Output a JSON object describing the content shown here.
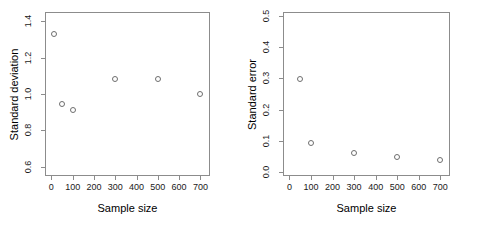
{
  "figure": {
    "panel_count": 2,
    "background": "#ffffff",
    "point_color": "#6e6e6e",
    "axis_color": "#8c8c8c"
  },
  "chart_data": [
    {
      "type": "scatter",
      "title": "",
      "xlabel": "Sample size",
      "ylabel": "Standard deviation",
      "x": [
        10,
        50,
        100,
        300,
        500,
        700
      ],
      "values": [
        1.33,
        0.945,
        0.91,
        1.08,
        1.08,
        1.0
      ],
      "xlim": [
        -30,
        745
      ],
      "ylim": [
        0.55,
        1.45
      ],
      "xticks": [
        0,
        100,
        200,
        300,
        400,
        500,
        600,
        700
      ],
      "xticklabels": [
        "0",
        "100",
        "200",
        "300",
        "400",
        "500",
        "600",
        "700"
      ],
      "yticks": [
        0.6,
        0.8,
        1.0,
        1.2,
        1.4
      ],
      "yticklabels": [
        "0.6",
        "0.8",
        "1.0",
        "1.2",
        "1.4"
      ],
      "grid": false,
      "legend": "none",
      "marker": "open-circle"
    },
    {
      "type": "scatter",
      "title": "",
      "xlabel": "Sample size",
      "ylabel": "Standard error",
      "x": [
        50,
        100,
        300,
        500,
        700
      ],
      "values": [
        0.297,
        0.092,
        0.063,
        0.049,
        0.038
      ],
      "xlim": [
        -30,
        745
      ],
      "ylim": [
        -0.012,
        0.512
      ],
      "xticks": [
        0,
        100,
        200,
        300,
        400,
        500,
        600,
        700
      ],
      "xticklabels": [
        "0",
        "100",
        "200",
        "300",
        "400",
        "500",
        "600",
        "700"
      ],
      "yticks": [
        0.0,
        0.1,
        0.2,
        0.3,
        0.4,
        0.5
      ],
      "yticklabels": [
        "0.0",
        "0.1",
        "0.2",
        "0.3",
        "0.4",
        "0.5"
      ],
      "grid": false,
      "legend": "none",
      "marker": "open-circle"
    }
  ]
}
